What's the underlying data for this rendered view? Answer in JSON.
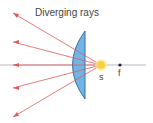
{
  "title": "Diverging rays",
  "labels": {
    "source": "s",
    "focal_point": "f"
  },
  "colors": {
    "ray": "#e05a5a",
    "lens_fill": "#6fb6e6",
    "lens_stroke": "#3a6ea5",
    "axis": "#b8b8c8",
    "source": "#f7d13a",
    "source_glow": "#fbe99a",
    "focal_point": "#222222",
    "text": "#444444"
  },
  "components": {
    "lens": "plano-convex-lens",
    "source": "point-light-source",
    "rays_count": 5
  }
}
